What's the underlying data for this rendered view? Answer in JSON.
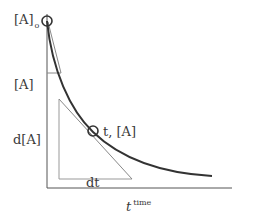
{
  "diagram": {
    "colors": {
      "curve": "#333333",
      "axes": "#555555",
      "tangent": "#888888",
      "marker": "#333333",
      "text": "#3a3a3a"
    },
    "labels": {
      "initial_conc": "[A]",
      "initial_conc_sub": "o",
      "conc": "[A]",
      "d_conc": "d[A]",
      "dt": "dt",
      "point": "t, [A]",
      "x_axis": "t",
      "x_axis_sup": "time"
    },
    "markers": [
      {
        "name": "initial-point",
        "label": "[A]o"
      },
      {
        "name": "tangent-point",
        "label": "t, [A]"
      }
    ]
  }
}
